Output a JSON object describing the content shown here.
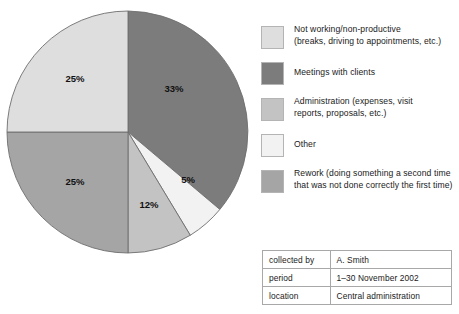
{
  "chart_data": {
    "type": "pie",
    "title": "",
    "categories": [
      "Meetings with clients",
      "Other",
      "Administration (expenses, visit reports, proposals, etc.)",
      "Rework (doing something a second time that was not done correctly the first time)",
      "Not working/non-productive (breaks, driving to appointments, etc.)"
    ],
    "values": [
      33,
      5,
      12,
      25,
      25
    ],
    "value_labels": [
      "33%",
      "5%",
      "12%",
      "25%",
      "25%"
    ],
    "colors": [
      "#7c7c7c",
      "#f2f2f2",
      "#c3c3c3",
      "#a5a5a5",
      "#dedede"
    ],
    "legend_position": "right",
    "start_angle_deg": 0,
    "direction": "clockwise",
    "xlabel": "",
    "ylabel": ""
  },
  "pie": {
    "slices": [
      {
        "name": "meetings-with-clients",
        "percent": 33,
        "label": "33%",
        "color": "#7c7c7c",
        "d": "M 124 124 L 124 3 A 121 121 0 0 1 215.83 201.46 Z",
        "label_x": 170,
        "label_y": 84
      },
      {
        "name": "other",
        "percent": 5,
        "label": "5%",
        "color": "#f2f2f2",
        "d": "M 124 124 L 215.83 201.46 A 121 121 0 0 1 186.28 227.25 Z",
        "label_x": 184,
        "label_y": 175
      },
      {
        "name": "administration",
        "percent": 12,
        "label": "12%",
        "color": "#c3c3c3",
        "d": "M 124 124 L 186.28 227.25 A 121 121 0 0 1 124 245 Z",
        "label_x": 145,
        "label_y": 200
      },
      {
        "name": "rework",
        "percent": 25,
        "label": "25%",
        "color": "#a5a5a5",
        "d": "M 124 124 L 124 245 A 121 121 0 0 1 3 124 Z",
        "label_x": 71,
        "label_y": 177
      },
      {
        "name": "not-working-non-productive",
        "percent": 25,
        "label": "25%",
        "color": "#dedede",
        "d": "M 124 124 L 3 124 A 121 121 0 0 1 124 3 Z",
        "label_x": 71,
        "label_y": 74
      }
    ]
  },
  "legend": {
    "items": [
      {
        "key": "not-working-non-productive",
        "color": "#dedede",
        "label": "Not working/non-productive\n(breaks, driving to appointments, etc.)",
        "lines": 2
      },
      {
        "key": "meetings-with-clients",
        "color": "#7c7c7c",
        "label": "Meetings with clients",
        "lines": 1
      },
      {
        "key": "administration",
        "color": "#c3c3c3",
        "label": "Administration (expenses, visit\nreports, proposals, etc.)",
        "lines": 2
      },
      {
        "key": "other",
        "color": "#f2f2f2",
        "label": "Other",
        "lines": 1
      },
      {
        "key": "rework",
        "color": "#a5a5a5",
        "label": "Rework (doing something a second time\nthat was not done correctly the first time)",
        "lines": 2
      }
    ]
  },
  "info_table": {
    "rows": [
      {
        "key": "collected by",
        "value": "A. Smith"
      },
      {
        "key": "period",
        "value": "1–30 November 2002"
      },
      {
        "key": "location",
        "value": "Central administration"
      }
    ]
  }
}
